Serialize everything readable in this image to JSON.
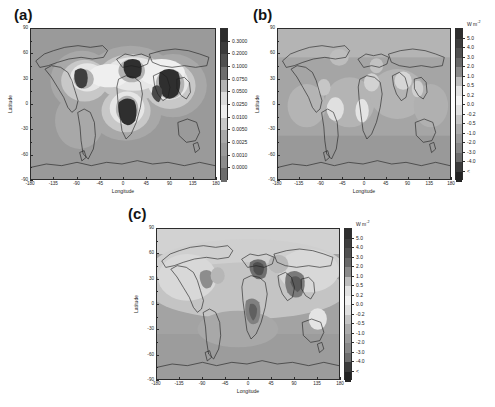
{
  "figure": {
    "type": "multi-panel-map-figure",
    "background": "#ffffff",
    "panel_count": 3
  },
  "panels": [
    {
      "id": "a",
      "label": "(a)",
      "xlabel": "Longitude",
      "ylabel": "Latitude",
      "xticks": [
        "-180",
        "-135",
        "-90",
        "-45",
        "0",
        "45",
        "90",
        "135",
        "180"
      ],
      "yticks": [
        "90",
        "60",
        "30",
        "0",
        "-30",
        "-60",
        "-90"
      ],
      "colorbar": {
        "unit": "",
        "labels": [
          "0.3000",
          "0.2000",
          "0.1000",
          "0.0750",
          "0.0500",
          "0.0250",
          "0.0100",
          "0.0050",
          "0.0025",
          "0.0010",
          "0.0000"
        ],
        "colors": [
          "#2b2b2b",
          "#3a3a3a",
          "#4f4f4f",
          "#6f6f6f",
          "#b3b3b3",
          "#dcdcdc",
          "#efefef",
          "#c8c8c8",
          "#a8a8a8",
          "#9a9a9a",
          "#8c8c8c",
          "#6b6b6b"
        ]
      }
    },
    {
      "id": "b",
      "label": "(b)",
      "xlabel": "Longitude",
      "ylabel": "Latitude",
      "xticks": [
        "-180",
        "-135",
        "-90",
        "-45",
        "0",
        "45",
        "90",
        "135",
        "180"
      ],
      "yticks": [
        "90",
        "60",
        "30",
        "0",
        "-30",
        "-60",
        "-90"
      ],
      "colorbar": {
        "unit": "W m",
        "unit_exponent": "-2",
        "labels": [
          "5.0",
          "4.0",
          "3.0",
          "2.0",
          "1.0",
          "0.5",
          "0.2",
          "0.0",
          "-0.2",
          "-0.5",
          "-1.0",
          "-2.0",
          "-3.0",
          "-4.0",
          "<"
        ],
        "colors": [
          "#2e2e2e",
          "#3d3d3d",
          "#505050",
          "#686868",
          "#8a8a8a",
          "#bdbdbd",
          "#e2e2e2",
          "#f2f2f2",
          "#e0e0e0",
          "#c4c4c4",
          "#ababab",
          "#9a9a9a",
          "#878787",
          "#6d6d6d",
          "#3b3b3b",
          "#242424"
        ]
      }
    },
    {
      "id": "c",
      "label": "(c)",
      "xlabel": "Longitude",
      "ylabel": "Latitude",
      "xticks": [
        "-180",
        "-135",
        "-90",
        "-45",
        "0",
        "45",
        "90",
        "135",
        "180"
      ],
      "yticks": [
        "90",
        "60",
        "30",
        "0",
        "-30",
        "-60",
        "-90"
      ],
      "colorbar": {
        "unit": "W m",
        "unit_exponent": "-2",
        "labels": [
          "5.0",
          "4.0",
          "3.0",
          "2.0",
          "1.0",
          "0.5",
          "0.2",
          "0.0",
          "-0.2",
          "-0.5",
          "-1.0",
          "-2.0",
          "-3.0",
          "-4.0",
          "<"
        ],
        "colors": [
          "#2e2e2e",
          "#3d3d3d",
          "#505050",
          "#686868",
          "#8a8a8a",
          "#bdbdbd",
          "#e2e2e2",
          "#f2f2f2",
          "#e0e0e0",
          "#c4c4c4",
          "#ababab",
          "#9a9a9a",
          "#878787",
          "#6d6d6d",
          "#3b3b3b",
          "#242424"
        ]
      }
    }
  ],
  "chart_data": {
    "type": "heatmap",
    "title": "",
    "projection": "equirectangular",
    "xlabel": "Longitude",
    "ylabel": "Latitude",
    "xlim": [
      -180,
      180
    ],
    "ylim": [
      -90,
      90
    ],
    "grid": false,
    "maps": [
      {
        "panel": "a",
        "quantity": "column burden / optical depth",
        "unit": "",
        "clim": [
          0.0,
          0.3
        ],
        "levels": [
          0.0,
          0.001,
          0.0025,
          0.005,
          0.01,
          0.025,
          0.05,
          0.075,
          0.1,
          0.2,
          0.3
        ],
        "colorbar_position": "right",
        "features": [
          {
            "region": "eastern North America",
            "lon": [
              -95,
              -70
            ],
            "lat": [
              28,
              45
            ],
            "value": 0.2
          },
          {
            "region": "Europe",
            "lon": [
              0,
              40
            ],
            "lat": [
              40,
              60
            ],
            "value": 0.3
          },
          {
            "region": "central Africa",
            "lon": [
              5,
              35
            ],
            "lat": [
              -12,
              12
            ],
            "value": 0.3
          },
          {
            "region": "India and Southeast Asia",
            "lon": [
              68,
              122
            ],
            "lat": [
              8,
              40
            ],
            "value": 0.3
          },
          {
            "region": "northern mid-latitude ocean",
            "lon": [
              -60,
              20
            ],
            "lat": [
              20,
              55
            ],
            "value": 0.05
          },
          {
            "region": "southern ocean",
            "lon": [
              -180,
              180
            ],
            "lat": [
              -90,
              -40
            ],
            "value": 0.001
          }
        ]
      },
      {
        "panel": "b",
        "quantity": "radiative forcing",
        "unit": "W m-2",
        "clim": [
          -4.0,
          5.0
        ],
        "levels": [
          -4.0,
          -3.0,
          -2.0,
          -1.0,
          -0.5,
          -0.2,
          0.0,
          0.2,
          0.5,
          1.0,
          2.0,
          3.0,
          4.0,
          5.0
        ],
        "colorbar_position": "right",
        "features": [
          {
            "region": "tropical Atlantic",
            "lon": [
              -40,
              -10
            ],
            "lat": [
              -10,
              15
            ],
            "value": 0.5
          },
          {
            "region": "equatorial Africa",
            "lon": [
              0,
              30
            ],
            "lat": [
              -5,
              10
            ],
            "value": 0.5
          },
          {
            "region": "central Asia",
            "lon": [
              60,
              100
            ],
            "lat": [
              25,
              45
            ],
            "value": 0.5
          },
          {
            "region": "high northern latitudes",
            "lon": [
              -180,
              180
            ],
            "lat": [
              60,
              90
            ],
            "value": 0.2
          },
          {
            "region": "southern ocean",
            "lon": [
              -180,
              180
            ],
            "lat": [
              -90,
              -45
            ],
            "value": -0.2
          }
        ]
      },
      {
        "panel": "c",
        "quantity": "radiative forcing",
        "unit": "W m-2",
        "clim": [
          -4.0,
          5.0
        ],
        "levels": [
          -4.0,
          -3.0,
          -2.0,
          -1.0,
          -0.5,
          -0.2,
          0.0,
          0.2,
          0.5,
          1.0,
          2.0,
          3.0,
          4.0,
          5.0
        ],
        "colorbar_position": "right",
        "features": [
          {
            "region": "Europe",
            "lon": [
              0,
              40
            ],
            "lat": [
              42,
              60
            ],
            "value": -3.0
          },
          {
            "region": "India and Southeast Asia",
            "lon": [
              70,
              120
            ],
            "lat": [
              8,
              35
            ],
            "value": -2.0
          },
          {
            "region": "central Africa",
            "lon": [
              5,
              30
            ],
            "lat": [
              -10,
              10
            ],
            "value": -2.0
          },
          {
            "region": "eastern North America",
            "lon": [
              -95,
              -70
            ],
            "lat": [
              28,
              45
            ],
            "value": -1.0
          },
          {
            "region": "northern ocean basins",
            "lon": [
              -180,
              180
            ],
            "lat": [
              10,
              60
            ],
            "value": -0.2
          },
          {
            "region": "southern ocean",
            "lon": [
              -180,
              180
            ],
            "lat": [
              -90,
              -40
            ],
            "value": 0.2
          }
        ]
      }
    ]
  }
}
